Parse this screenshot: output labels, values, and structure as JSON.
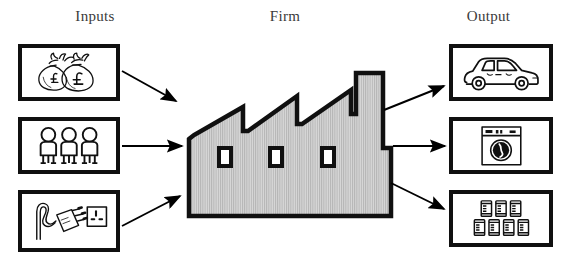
{
  "diagram": {
    "title_columns": {
      "inputs": "Inputs",
      "firm": "Firm",
      "output": "Output"
    },
    "colors": {
      "stroke": "#101010",
      "background": "#ffffff",
      "factory_fill": "#cfcfcf",
      "label_text": "#3a3a3a",
      "arrow": "#000000"
    },
    "inputs": [
      {
        "id": "money",
        "icon": "money-bags-icon",
        "description": "Two money sacks marked with pound sterling symbols",
        "currency_symbol": "£",
        "count": 2
      },
      {
        "id": "labour",
        "icon": "people-icon",
        "description": "Three human figures representing labour",
        "count": 3
      },
      {
        "id": "power",
        "icon": "plug-and-socket-icon",
        "description": "Electrical plug with cable and a wall socket",
        "count": 2
      }
    ],
    "firm": {
      "id": "factory",
      "icon": "factory-icon",
      "description": "Factory building with sawtooth roof, chimney and three windows",
      "roof_peaks": 3,
      "windows": 3,
      "chimneys": 1
    },
    "outputs": [
      {
        "id": "car",
        "icon": "car-icon",
        "description": "Motor car",
        "count": 1
      },
      {
        "id": "washing-machine",
        "icon": "washing-machine-icon",
        "description": "Front loading washing machine with control panel",
        "count": 1
      },
      {
        "id": "cans",
        "icon": "cans-icon",
        "description": "Seven canned goods stacked in two rows",
        "count": 7
      }
    ],
    "arrows": [
      {
        "id": "arrow-money-to-firm",
        "from": "money",
        "to": "factory",
        "direction": "down-right"
      },
      {
        "id": "arrow-labour-to-firm",
        "from": "labour",
        "to": "factory",
        "direction": "right"
      },
      {
        "id": "arrow-power-to-firm",
        "from": "power",
        "to": "factory",
        "direction": "up-right"
      },
      {
        "id": "arrow-firm-to-car",
        "from": "factory",
        "to": "car",
        "direction": "up-right"
      },
      {
        "id": "arrow-firm-to-washer",
        "from": "factory",
        "to": "washing-machine",
        "direction": "right"
      },
      {
        "id": "arrow-firm-to-cans",
        "from": "factory",
        "to": "cans",
        "direction": "down-right"
      }
    ]
  }
}
